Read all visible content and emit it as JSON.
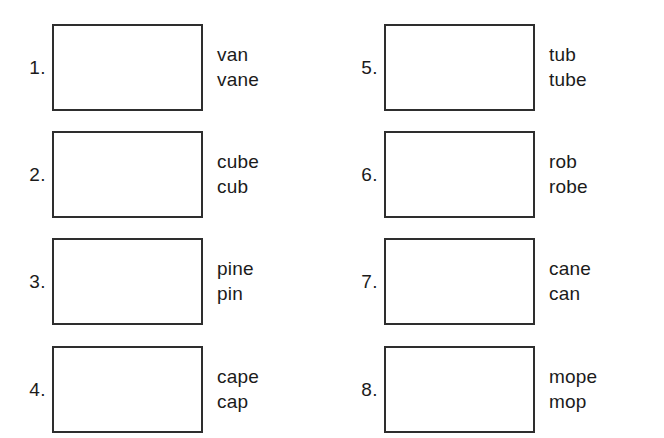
{
  "worksheet": {
    "background_color": "#ffffff",
    "box_border_color": "#2e2e2e",
    "text_color": "#1b1b1b",
    "items": [
      {
        "number": "1.",
        "word_top": "van",
        "word_bottom": "vane"
      },
      {
        "number": "2.",
        "word_top": "cube",
        "word_bottom": "cub"
      },
      {
        "number": "3.",
        "word_top": "pine",
        "word_bottom": "pin"
      },
      {
        "number": "4.",
        "word_top": "cape",
        "word_bottom": "cap"
      },
      {
        "number": "5.",
        "word_top": "tub",
        "word_bottom": "tube"
      },
      {
        "number": "6.",
        "word_top": "rob",
        "word_bottom": "robe"
      },
      {
        "number": "7.",
        "word_top": "cane",
        "word_bottom": "can"
      },
      {
        "number": "8.",
        "word_top": "mope",
        "word_bottom": "mop"
      }
    ]
  }
}
